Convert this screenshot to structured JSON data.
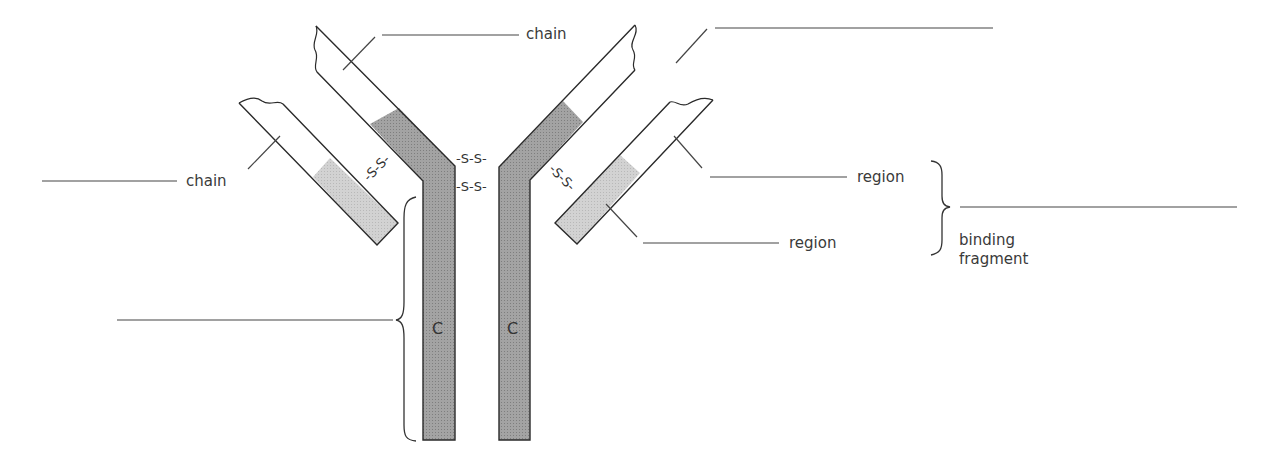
{
  "diagram": {
    "colors": {
      "outline": "#2a2a2a",
      "constant_region_heavy": "#9c9c9c",
      "constant_region_light": "#cdcdcd",
      "variable_region": "#ffffff",
      "leader_line": "#444444"
    },
    "labels": {
      "heavy_chain": "chain",
      "light_chain": "chain",
      "variable_region": "region",
      "constant_region": "region",
      "fab_line1": "binding",
      "fab_line2": "fragment"
    },
    "disulfide_bonds": {
      "hinge_top": "-S-S-",
      "hinge_bottom": "-S-S-",
      "left_light_heavy": "-S-S-",
      "right_light_heavy": "-S-S-"
    },
    "stem_letters": {
      "left": "C",
      "right": "C"
    },
    "blanks": {
      "top_right": "",
      "left_chain": "",
      "fab": "",
      "fc": ""
    }
  }
}
